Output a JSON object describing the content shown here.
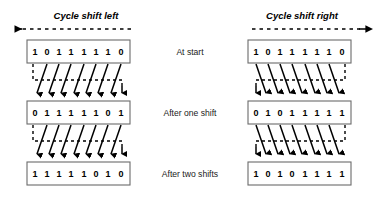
{
  "figure": {
    "background_color": "#ffffff",
    "line_color": "#000000",
    "box_stroke_color": "#6b6b6b"
  },
  "panels": [
    {
      "key": "left",
      "title": "Cycle shift left",
      "direction": "left",
      "arrow_glyph": "left-arrow-icon",
      "rows": [
        {
          "bits": [
            "1",
            "0",
            "1",
            "1",
            "1",
            "1",
            "1",
            "0"
          ]
        },
        {
          "bits": [
            "0",
            "1",
            "1",
            "1",
            "1",
            "1",
            "0",
            "1"
          ]
        },
        {
          "bits": [
            "1",
            "1",
            "1",
            "1",
            "1",
            "0",
            "1",
            "0"
          ]
        }
      ]
    },
    {
      "key": "right",
      "title": "Cycle shift right",
      "direction": "right",
      "arrow_glyph": "right-arrow-icon",
      "rows": [
        {
          "bits": [
            "1",
            "0",
            "1",
            "1",
            "1",
            "1",
            "1",
            "0"
          ]
        },
        {
          "bits": [
            "0",
            "1",
            "0",
            "1",
            "1",
            "1",
            "1",
            "1"
          ]
        },
        {
          "bits": [
            "1",
            "0",
            "1",
            "0",
            "1",
            "1",
            "1",
            "1"
          ]
        }
      ]
    }
  ],
  "stage_labels": [
    "At start",
    "After one shift",
    "After two shifts"
  ]
}
